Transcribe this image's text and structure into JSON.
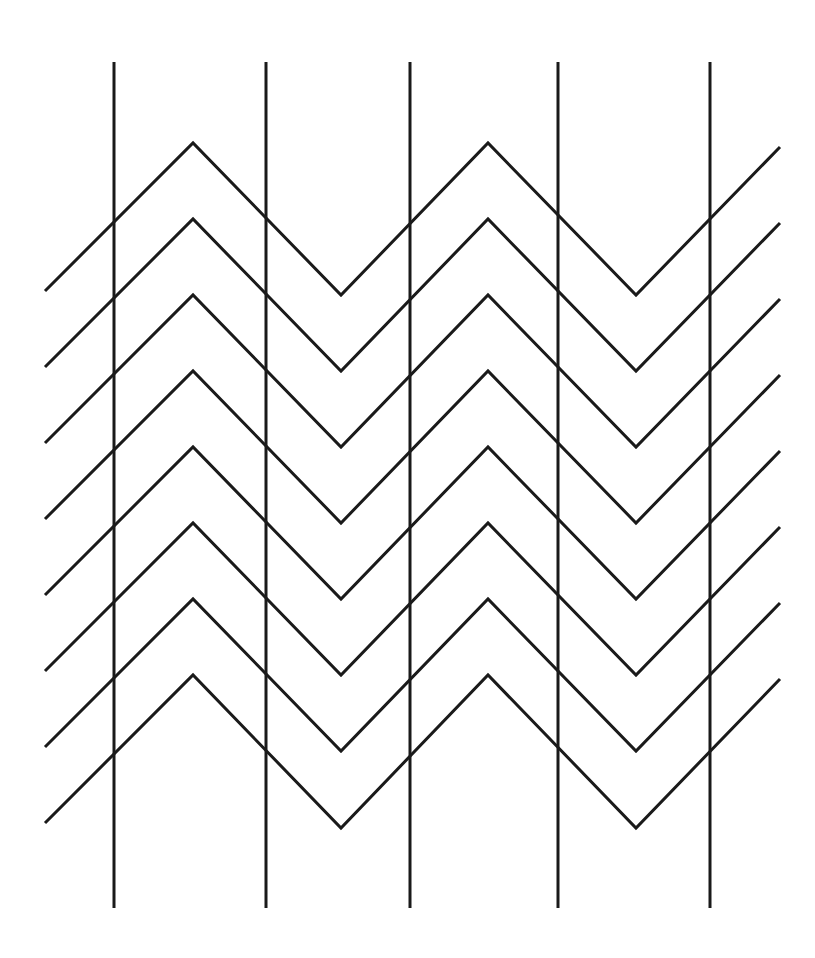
{
  "figure": {
    "canvas": {
      "width": 815,
      "height": 958,
      "background_color": "#ffffff"
    },
    "stroke": {
      "color": "#1a1a1a",
      "width": 3,
      "linecap": "butt",
      "linejoin": "miter"
    }
  },
  "chart_data": {
    "type": "line",
    "subtitle": "",
    "xlabel": "",
    "ylabel": "",
    "xlim": [
      0,
      815
    ],
    "ylim": [
      958,
      0
    ],
    "grid": false,
    "legend": null,
    "annotations": [],
    "geometry": {
      "coordinate_system": "pixels, origin top-left, y increases downward",
      "zigzag": {
        "row_count": 8,
        "row_spacing_y": 76,
        "first_peak_y": 143,
        "peak_x_positions": [
          193,
          488
        ],
        "valley_x_positions": [
          341,
          636
        ],
        "peak_to_valley_dy": 152,
        "half_period_x": 147.5,
        "period_x": 295,
        "x_start": 45,
        "x_end": 780,
        "slope_abs": 1.03
      },
      "verticals": {
        "count": 5,
        "x_positions": [
          114,
          266,
          410,
          558,
          710
        ],
        "y_top": 62,
        "y_bottom": 908,
        "spacing_x": [
          152,
          144,
          148,
          152
        ]
      }
    },
    "series": [
      {
        "name": "zigzag-row-1",
        "points": [
          [
            45,
            291
          ],
          [
            193,
            143
          ],
          [
            341,
            295
          ],
          [
            488,
            143
          ],
          [
            636,
            295
          ],
          [
            780,
            147
          ]
        ]
      },
      {
        "name": "zigzag-row-2",
        "points": [
          [
            45,
            367
          ],
          [
            193,
            219
          ],
          [
            341,
            371
          ],
          [
            488,
            219
          ],
          [
            636,
            371
          ],
          [
            780,
            223
          ]
        ]
      },
      {
        "name": "zigzag-row-3",
        "points": [
          [
            45,
            443
          ],
          [
            193,
            295
          ],
          [
            341,
            447
          ],
          [
            488,
            295
          ],
          [
            636,
            447
          ],
          [
            780,
            299
          ]
        ]
      },
      {
        "name": "zigzag-row-4",
        "points": [
          [
            45,
            519
          ],
          [
            193,
            371
          ],
          [
            341,
            523
          ],
          [
            488,
            371
          ],
          [
            636,
            523
          ],
          [
            780,
            375
          ]
        ]
      },
      {
        "name": "zigzag-row-5",
        "points": [
          [
            45,
            595
          ],
          [
            193,
            447
          ],
          [
            341,
            599
          ],
          [
            488,
            447
          ],
          [
            636,
            599
          ],
          [
            780,
            451
          ]
        ]
      },
      {
        "name": "zigzag-row-6",
        "points": [
          [
            45,
            671
          ],
          [
            193,
            523
          ],
          [
            341,
            675
          ],
          [
            488,
            523
          ],
          [
            636,
            675
          ],
          [
            780,
            527
          ]
        ]
      },
      {
        "name": "zigzag-row-7",
        "points": [
          [
            45,
            747
          ],
          [
            193,
            599
          ],
          [
            341,
            751
          ],
          [
            488,
            599
          ],
          [
            636,
            751
          ],
          [
            780,
            603
          ]
        ]
      },
      {
        "name": "zigzag-row-8",
        "points": [
          [
            45,
            823
          ],
          [
            193,
            675
          ],
          [
            341,
            828
          ],
          [
            488,
            675
          ],
          [
            636,
            828
          ],
          [
            780,
            679
          ]
        ]
      },
      {
        "name": "vertical-line-1",
        "points": [
          [
            114,
            62
          ],
          [
            114,
            908
          ]
        ]
      },
      {
        "name": "vertical-line-2",
        "points": [
          [
            266,
            62
          ],
          [
            266,
            908
          ]
        ]
      },
      {
        "name": "vertical-line-3",
        "points": [
          [
            410,
            62
          ],
          [
            410,
            908
          ]
        ]
      },
      {
        "name": "vertical-line-4",
        "points": [
          [
            558,
            62
          ],
          [
            558,
            908
          ]
        ]
      },
      {
        "name": "vertical-line-5",
        "points": [
          [
            710,
            62
          ],
          [
            710,
            908
          ]
        ]
      }
    ]
  }
}
